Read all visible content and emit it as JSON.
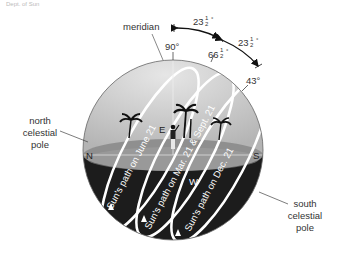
{
  "header_caption": "Dept. of Sun",
  "labels": {
    "meridian": "meridian",
    "north_pole": [
      "north",
      "celestial",
      "pole"
    ],
    "south_pole": [
      "south",
      "celestial",
      "pole"
    ],
    "north": "N",
    "south": "S",
    "east": "E",
    "west": "W"
  },
  "angles": {
    "zenith": "90°",
    "summer": "66",
    "equinox_arc": "43°",
    "half_fraction_num": "1",
    "half_fraction_den": "2",
    "arc_upper": "23",
    "arc_lower": "23",
    "degree": "°"
  },
  "paths": {
    "june": "Sun's path on June 21",
    "equinox": "Sun's path on Mar. 21 & Sept. 21",
    "december": "Sun's path on Dec. 21"
  },
  "colors": {
    "sky": "#c9c9c9",
    "horizon_plane": "#8f8f8f",
    "ground": "#1e1e1e",
    "path": "#ffffff",
    "text": "#333333"
  }
}
